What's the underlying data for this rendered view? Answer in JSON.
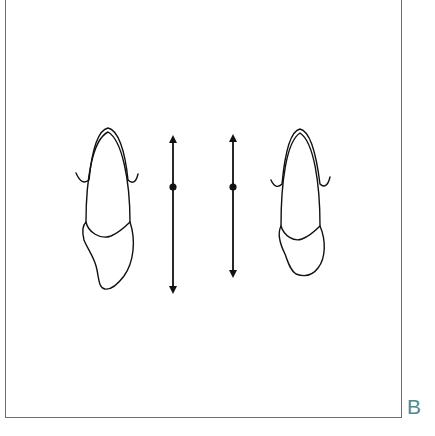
{
  "figure": {
    "panel_label": "B",
    "colors": {
      "stroke": "#111111",
      "frame": "#6e6e6e",
      "label": "#4f8a92",
      "background": "#ffffff"
    },
    "elements": [
      {
        "type": "tooth-outline",
        "id": "left-tooth",
        "orientation": "crown-up, root tip leaning left"
      },
      {
        "type": "double-arrow",
        "id": "left-arrow",
        "x": 173,
        "y_top": 133,
        "y_bottom": 296,
        "dot_y": 187
      },
      {
        "type": "double-arrow",
        "id": "right-arrow",
        "x": 233,
        "y_top": 132,
        "y_bottom": 280,
        "dot_y": 187
      },
      {
        "type": "tooth-outline",
        "id": "right-tooth",
        "orientation": "crown-up, rounded base"
      }
    ]
  }
}
